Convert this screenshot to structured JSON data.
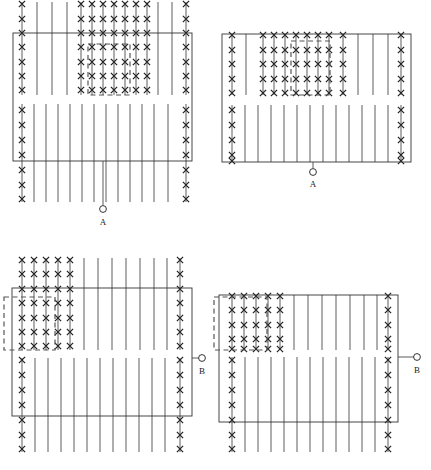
{
  "figure": {
    "width": 431,
    "height": 470,
    "background": "#ffffff",
    "ink_color": "#333333",
    "marker_color": "#222222",
    "dashed_color": "#555555",
    "line_width": 0.8,
    "rect_line_width": 0.9,
    "marker_glyph": "x",
    "marker_size": 3.1
  },
  "panels": [
    {
      "id": "panel-top-left",
      "name": "diagram-panel-1",
      "rect": {
        "x": 13,
        "y": 33,
        "w": 179,
        "h": 128
      },
      "terminal": {
        "label": "A",
        "kind": "circle-terminal",
        "orientation": "vertical",
        "lead_x": 103,
        "lead_y1": 161,
        "lead_y2": 205,
        "circle_cx": 103,
        "circle_cy": 209,
        "circle_r": 3.4,
        "label_x": 103,
        "label_y": 225
      },
      "dashed_box": {
        "x": 88,
        "y": 44,
        "w": 42,
        "h": 51
      },
      "upper_band": {
        "y1": 2,
        "y2": 95
      },
      "lower_band": {
        "y1": 104,
        "y2": 202
      },
      "upper_lines": [
        {
          "x": 22,
          "marked": true
        },
        {
          "x": 37,
          "marked": false
        },
        {
          "x": 52,
          "marked": false
        },
        {
          "x": 67,
          "marked": false
        },
        {
          "x": 81,
          "marked": true
        },
        {
          "x": 92,
          "marked": true
        },
        {
          "x": 103,
          "marked": true
        },
        {
          "x": 114,
          "marked": true
        },
        {
          "x": 125,
          "marked": true
        },
        {
          "x": 136,
          "marked": true
        },
        {
          "x": 147,
          "marked": true
        },
        {
          "x": 158,
          "marked": false
        },
        {
          "x": 172,
          "marked": false
        },
        {
          "x": 186,
          "marked": true
        }
      ],
      "lower_lines": [
        {
          "x": 22,
          "marked": true
        },
        {
          "x": 34,
          "marked": false
        },
        {
          "x": 46,
          "marked": false
        },
        {
          "x": 58,
          "marked": false
        },
        {
          "x": 70,
          "marked": false
        },
        {
          "x": 82,
          "marked": false
        },
        {
          "x": 94,
          "marked": false
        },
        {
          "x": 106,
          "marked": false
        },
        {
          "x": 118,
          "marked": false
        },
        {
          "x": 130,
          "marked": false
        },
        {
          "x": 142,
          "marked": false
        },
        {
          "x": 154,
          "marked": false
        },
        {
          "x": 168,
          "marked": false
        },
        {
          "x": 186,
          "marked": true
        }
      ],
      "upper_marker_rows": [
        4,
        19,
        33,
        47,
        62,
        76,
        90
      ],
      "lower_marker_rows": [
        110,
        125,
        140,
        155,
        170,
        185,
        199
      ]
    },
    {
      "id": "panel-top-right",
      "name": "diagram-panel-2",
      "rect": {
        "x": 222,
        "y": 34,
        "w": 189,
        "h": 128
      },
      "terminal": {
        "label": "A",
        "kind": "circle-terminal",
        "orientation": "vertical",
        "lead_x": 313,
        "lead_y1": 162,
        "lead_y2": 168,
        "circle_cx": 313,
        "circle_cy": 172,
        "circle_r": 3.4,
        "label_x": 313,
        "label_y": 187
      },
      "dashed_box": {
        "x": 291,
        "y": 41,
        "w": 39,
        "h": 54
      },
      "upper_band": {
        "y1": 34,
        "y2": 95
      },
      "lower_band": {
        "y1": 105,
        "y2": 162
      },
      "upper_lines": [
        {
          "x": 232,
          "marked": true
        },
        {
          "x": 246,
          "marked": false
        },
        {
          "x": 263,
          "marked": true
        },
        {
          "x": 274,
          "marked": true
        },
        {
          "x": 285,
          "marked": true
        },
        {
          "x": 296,
          "marked": true
        },
        {
          "x": 307,
          "marked": true
        },
        {
          "x": 318,
          "marked": true
        },
        {
          "x": 329,
          "marked": true
        },
        {
          "x": 343,
          "marked": true
        },
        {
          "x": 358,
          "marked": false
        },
        {
          "x": 373,
          "marked": false
        },
        {
          "x": 388,
          "marked": false
        },
        {
          "x": 401,
          "marked": true
        }
      ],
      "lower_lines": [
        {
          "x": 232,
          "marked": true
        },
        {
          "x": 245,
          "marked": false
        },
        {
          "x": 258,
          "marked": false
        },
        {
          "x": 271,
          "marked": false
        },
        {
          "x": 284,
          "marked": false
        },
        {
          "x": 297,
          "marked": false
        },
        {
          "x": 310,
          "marked": false
        },
        {
          "x": 323,
          "marked": false
        },
        {
          "x": 336,
          "marked": false
        },
        {
          "x": 349,
          "marked": false
        },
        {
          "x": 362,
          "marked": false
        },
        {
          "x": 375,
          "marked": false
        },
        {
          "x": 388,
          "marked": false
        },
        {
          "x": 401,
          "marked": true
        }
      ],
      "upper_marker_rows": [
        35,
        50,
        64,
        79,
        93
      ],
      "lower_marker_rows": [
        110,
        125,
        140,
        155,
        161
      ]
    },
    {
      "id": "panel-bottom-left",
      "name": "diagram-panel-3",
      "rect": {
        "x": 12,
        "y": 288,
        "w": 180,
        "h": 128
      },
      "terminal": {
        "label": "B",
        "kind": "circle-terminal",
        "orientation": "horizontal",
        "lead_y": 358,
        "lead_x1": 192,
        "lead_x2": 199,
        "circle_cx": 202,
        "circle_cy": 358,
        "circle_r": 3.4,
        "label_x": 202,
        "label_y": 374
      },
      "dashed_box": {
        "x": 4,
        "y": 297,
        "w": 51,
        "h": 53
      },
      "upper_band": {
        "y1": 258,
        "y2": 350
      },
      "lower_band": {
        "y1": 358,
        "y2": 452
      },
      "upper_lines": [
        {
          "x": 22,
          "marked": true
        },
        {
          "x": 34,
          "marked": true
        },
        {
          "x": 46,
          "marked": true
        },
        {
          "x": 58,
          "marked": true
        },
        {
          "x": 70,
          "marked": true
        },
        {
          "x": 84,
          "marked": false
        },
        {
          "x": 98,
          "marked": false
        },
        {
          "x": 112,
          "marked": false
        },
        {
          "x": 126,
          "marked": false
        },
        {
          "x": 140,
          "marked": false
        },
        {
          "x": 154,
          "marked": false
        },
        {
          "x": 167,
          "marked": false
        },
        {
          "x": 180,
          "marked": true
        }
      ],
      "lower_lines": [
        {
          "x": 22,
          "marked": true
        },
        {
          "x": 35,
          "marked": false
        },
        {
          "x": 48,
          "marked": false
        },
        {
          "x": 61,
          "marked": false
        },
        {
          "x": 74,
          "marked": false
        },
        {
          "x": 87,
          "marked": false
        },
        {
          "x": 100,
          "marked": false
        },
        {
          "x": 113,
          "marked": false
        },
        {
          "x": 126,
          "marked": false
        },
        {
          "x": 139,
          "marked": false
        },
        {
          "x": 152,
          "marked": false
        },
        {
          "x": 165,
          "marked": false
        },
        {
          "x": 180,
          "marked": true
        }
      ],
      "upper_marker_rows": [
        260,
        274,
        289,
        303,
        318,
        332,
        346
      ],
      "lower_marker_rows": [
        360,
        375,
        390,
        405,
        420,
        435,
        449
      ]
    },
    {
      "id": "panel-bottom-right",
      "name": "diagram-panel-4",
      "rect": {
        "x": 219,
        "y": 295,
        "w": 179,
        "h": 127
      },
      "terminal": {
        "label": "B",
        "kind": "circle-terminal",
        "orientation": "horizontal",
        "lead_y": 357,
        "lead_x1": 398,
        "lead_x2": 414,
        "circle_cx": 417,
        "circle_cy": 357,
        "circle_r": 3.4,
        "label_x": 417,
        "label_y": 373
      },
      "dashed_box": {
        "x": 214,
        "y": 297,
        "w": 53,
        "h": 53
      },
      "upper_band": {
        "y1": 295,
        "y2": 350
      },
      "lower_band": {
        "y1": 357,
        "y2": 452
      },
      "upper_lines": [
        {
          "x": 232,
          "marked": true
        },
        {
          "x": 244,
          "marked": true
        },
        {
          "x": 256,
          "marked": true
        },
        {
          "x": 268,
          "marked": true
        },
        {
          "x": 280,
          "marked": true
        },
        {
          "x": 294,
          "marked": false
        },
        {
          "x": 308,
          "marked": false
        },
        {
          "x": 322,
          "marked": false
        },
        {
          "x": 336,
          "marked": false
        },
        {
          "x": 350,
          "marked": false
        },
        {
          "x": 364,
          "marked": false
        },
        {
          "x": 377,
          "marked": false
        },
        {
          "x": 388,
          "marked": true
        }
      ],
      "lower_lines": [
        {
          "x": 232,
          "marked": true
        },
        {
          "x": 245,
          "marked": false
        },
        {
          "x": 258,
          "marked": false
        },
        {
          "x": 271,
          "marked": false
        },
        {
          "x": 284,
          "marked": false
        },
        {
          "x": 297,
          "marked": false
        },
        {
          "x": 310,
          "marked": false
        },
        {
          "x": 323,
          "marked": false
        },
        {
          "x": 336,
          "marked": false
        },
        {
          "x": 349,
          "marked": false
        },
        {
          "x": 362,
          "marked": false
        },
        {
          "x": 375,
          "marked": false
        },
        {
          "x": 388,
          "marked": true
        }
      ],
      "upper_marker_rows": [
        296,
        310,
        325,
        339,
        349
      ],
      "lower_marker_rows": [
        360,
        375,
        390,
        405,
        420,
        435,
        449
      ]
    }
  ]
}
